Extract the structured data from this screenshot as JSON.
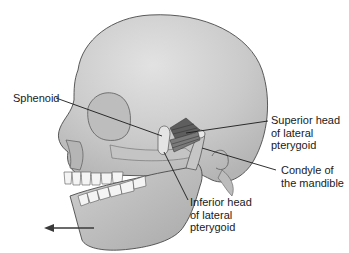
{
  "figure": {
    "labels": [
      {
        "id": "sphenoid",
        "text": "Sphenoid"
      },
      {
        "id": "superior-head",
        "text": "Superior head\nof lateral\npterygoid"
      },
      {
        "id": "condyle",
        "text": "Condyle of\nthe mandible"
      },
      {
        "id": "inferior-head",
        "text": "Inferior head\nof lateral\npterygoid"
      }
    ],
    "arrow": {
      "direction": "left",
      "meaning": "mandible protrusion"
    },
    "colors": {
      "bone": "#c9c9c9",
      "bone_light": "#dedede",
      "bone_shadow": "#a8a8a8",
      "muscle": "#6e6e6e",
      "outline": "#4a4a4a",
      "leader": "#1a1a1a",
      "teeth": "#f4f4f4"
    }
  }
}
